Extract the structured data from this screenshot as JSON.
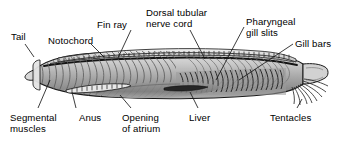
{
  "figure": {
    "background_color": "#ffffff",
    "outline_color": "#1a1a1a",
    "body_light": "#dcdcdc",
    "body_mid": "#b4b4b4",
    "body_dark": "#6e6e6e",
    "body_darkest": "#3a3a3a",
    "label_color": "#000000",
    "leader_color": "#1a1a1a"
  },
  "labels": [
    {
      "id": "tail",
      "text": "Tail",
      "x": 11,
      "y": 32
    },
    {
      "id": "notochord",
      "text": "Notochord",
      "x": 48,
      "y": 36
    },
    {
      "id": "fin_ray",
      "text": "Fin ray",
      "x": 97,
      "y": 20
    },
    {
      "id": "nerve_cord_1",
      "text": "Dorsal tubular",
      "x": 146,
      "y": 8
    },
    {
      "id": "nerve_cord_2",
      "text": "nerve cord",
      "x": 146,
      "y": 19
    },
    {
      "id": "gill_slits_1",
      "text": "Pharyngeal",
      "x": 246,
      "y": 17
    },
    {
      "id": "gill_slits_2",
      "text": "gill slits",
      "x": 246,
      "y": 28
    },
    {
      "id": "gill_bars",
      "text": "Gill bars",
      "x": 295,
      "y": 39
    },
    {
      "id": "seg_muscles_1",
      "text": "Segmental",
      "x": 10,
      "y": 113
    },
    {
      "id": "seg_muscles_2",
      "text": "muscles",
      "x": 10,
      "y": 124
    },
    {
      "id": "anus",
      "text": "Anus",
      "x": 79,
      "y": 113
    },
    {
      "id": "atrium_1",
      "text": "Opening",
      "x": 122,
      "y": 113
    },
    {
      "id": "atrium_2",
      "text": "of atrium",
      "x": 122,
      "y": 124
    },
    {
      "id": "liver",
      "text": "Liver",
      "x": 189,
      "y": 113
    },
    {
      "id": "tentacles",
      "text": "Tentacles",
      "x": 270,
      "y": 113
    }
  ],
  "leaders": [
    {
      "id": "tail",
      "x1": 25,
      "y1": 44,
      "x2": 34,
      "y2": 57
    },
    {
      "id": "notochord",
      "x1": 91,
      "y1": 44,
      "x2": 104,
      "y2": 57
    },
    {
      "id": "fin_ray",
      "x1": 131,
      "y1": 30,
      "x2": 117,
      "y2": 60
    },
    {
      "id": "nerve_cord",
      "x1": 190,
      "y1": 30,
      "x2": 205,
      "y2": 59
    },
    {
      "id": "gill_slits",
      "x1": 244,
      "y1": 27,
      "x2": 216,
      "y2": 80
    },
    {
      "id": "gill_bars",
      "x1": 293,
      "y1": 44,
      "x2": 239,
      "y2": 80
    },
    {
      "id": "seg_muscles",
      "x1": 38,
      "y1": 108,
      "x2": 50,
      "y2": 80
    },
    {
      "id": "anus",
      "x1": 76,
      "y1": 108,
      "x2": 72,
      "y2": 92
    },
    {
      "id": "atrium",
      "x1": 131,
      "y1": 108,
      "x2": 120,
      "y2": 95
    },
    {
      "id": "liver",
      "x1": 198,
      "y1": 108,
      "x2": 190,
      "y2": 92
    },
    {
      "id": "tentacles",
      "x1": 297,
      "y1": 108,
      "x2": 302,
      "y2": 99
    }
  ]
}
